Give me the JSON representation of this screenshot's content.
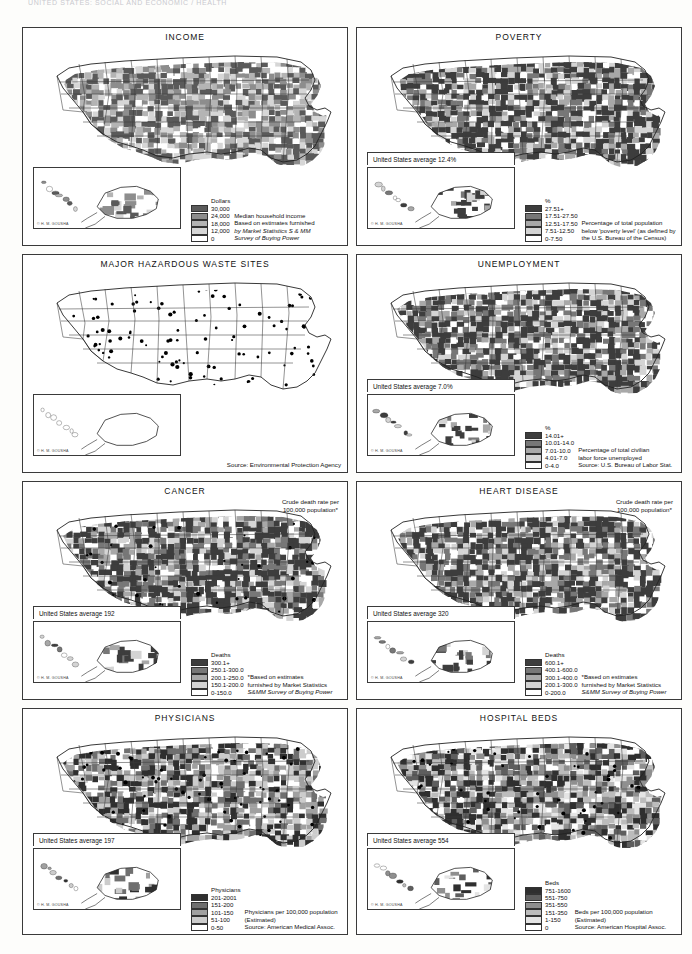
{
  "page": {
    "header": "UNITED STATES: SOCIAL AND ECONOMIC / HEALTH"
  },
  "copyright_mark": "© H. M. GOUSHA",
  "legend_unit_labels": {
    "dollars": "Dollars",
    "percent": "%",
    "deaths": "Deaths",
    "physicians": "Physicians",
    "beds": "Beds"
  },
  "panels": [
    {
      "id": "income",
      "title": "INCOME",
      "us_average": "",
      "legend_unit": "Dollars",
      "legend_classes": [
        {
          "label": "30,000",
          "color": "#5a5a5a"
        },
        {
          "label": "24,000",
          "color": "#8d8d8d"
        },
        {
          "label": "18,000",
          "color": "#b4b4b4"
        },
        {
          "label": "12,000",
          "color": "#d6d6d6"
        },
        {
          "label": "0",
          "color": "#ffffff"
        }
      ],
      "note_lines": [
        "Median household income",
        "Based on estimates furnished",
        "by Market Statistics S & MM",
        "Survey of Buying Power"
      ],
      "note_italic_lines": [
        2,
        3
      ],
      "top_note": "",
      "source_note": ""
    },
    {
      "id": "poverty",
      "title": "POVERTY",
      "us_average": "United States average 12.4%",
      "legend_unit": "%",
      "legend_classes": [
        {
          "label": "27.51+",
          "color": "#3d3d3d"
        },
        {
          "label": "17.51-27.50",
          "color": "#777777"
        },
        {
          "label": "12.51-17.50",
          "color": "#a8a8a8"
        },
        {
          "label": "7.51-12.50",
          "color": "#d4d4d4"
        },
        {
          "label": "0-7.50",
          "color": "#ffffff"
        }
      ],
      "note_lines": [
        "Percentage of total population",
        "below 'poverty level' (as defined by",
        "the U.S. Bureau of the Census)"
      ],
      "note_italic_lines": [],
      "top_note": "",
      "source_note": ""
    },
    {
      "id": "hazardous-waste",
      "title": "MAJOR HAZARDOUS WASTE SITES",
      "us_average": "",
      "legend_unit": "",
      "legend_classes": [],
      "note_lines": [],
      "note_italic_lines": [],
      "top_note": "",
      "source_note": "Source: Environmental Protection Agency"
    },
    {
      "id": "unemployment",
      "title": "UNEMPLOYMENT",
      "us_average": "United States average 7.0%",
      "legend_unit": "%",
      "legend_classes": [
        {
          "label": "14.01+",
          "color": "#3d3d3d"
        },
        {
          "label": "10.01-14.0",
          "color": "#777777"
        },
        {
          "label": "7.01-10.0",
          "color": "#a8a8a8"
        },
        {
          "label": "4.01-7.0",
          "color": "#d4d4d4"
        },
        {
          "label": "0-4.0",
          "color": "#ffffff"
        }
      ],
      "note_lines": [
        "Percentage of total civilian",
        "labor force unemployed",
        "Source: U.S. Bureau of Labor Stat."
      ],
      "note_italic_lines": [],
      "top_note": "",
      "source_note": ""
    },
    {
      "id": "cancer",
      "title": "CANCER",
      "us_average": "United States average 192",
      "legend_unit": "Deaths",
      "legend_classes": [
        {
          "label": "300.1+",
          "color": "#3d3d3d"
        },
        {
          "label": "250.1-300.0",
          "color": "#777777"
        },
        {
          "label": "200.1-250.0",
          "color": "#a8a8a8"
        },
        {
          "label": "150.1-200.0",
          "color": "#d4d4d4"
        },
        {
          "label": "0-150.0",
          "color": "#ffffff"
        }
      ],
      "note_lines": [
        "*Based on estimates",
        "furnished by Market Statistics",
        "S&MM Survey of Buying Power"
      ],
      "note_italic_lines": [
        2
      ],
      "top_note": "Crude death rate per\n100,000 population*",
      "source_note": ""
    },
    {
      "id": "heart-disease",
      "title": "HEART DISEASE",
      "us_average": "United States average 320",
      "legend_unit": "Deaths",
      "legend_classes": [
        {
          "label": "600.1+",
          "color": "#3d3d3d"
        },
        {
          "label": "400.1-600.0",
          "color": "#777777"
        },
        {
          "label": "300.1-400.0",
          "color": "#a8a8a8"
        },
        {
          "label": "200.1-300.0",
          "color": "#d4d4d4"
        },
        {
          "label": "0-200.0",
          "color": "#ffffff"
        }
      ],
      "note_lines": [
        "*Based on estimates",
        "furnished by Market Statistics",
        "S&MM Survey of Buying Power"
      ],
      "note_italic_lines": [
        2
      ],
      "top_note": "Crude death rate per\n100,000 population*",
      "source_note": ""
    },
    {
      "id": "physicians",
      "title": "PHYSICIANS",
      "us_average": "United States average 197",
      "legend_unit": "Physicians",
      "legend_classes": [
        {
          "label": "201-2001",
          "color": "#2f2f2f"
        },
        {
          "label": "151-200",
          "color": "#6f6f6f"
        },
        {
          "label": "101-150",
          "color": "#a0a0a0"
        },
        {
          "label": "51-100",
          "color": "#cccccc"
        },
        {
          "label": "0-50",
          "color": "#ffffff"
        }
      ],
      "note_lines": [
        "Physicians per 100,000 population",
        "(Estimated)",
        "Source: American Medical Assoc."
      ],
      "note_italic_lines": [],
      "top_note": "",
      "source_note": ""
    },
    {
      "id": "hospital-beds",
      "title": "HOSPITAL BEDS",
      "us_average": "United States average 554",
      "legend_unit": "Beds",
      "legend_classes": [
        {
          "label": "751-1600",
          "color": "#2f2f2f"
        },
        {
          "label": "551-750",
          "color": "#5e5e5e"
        },
        {
          "label": "351-550",
          "color": "#8f8f8f"
        },
        {
          "label": "151-350",
          "color": "#bcbcbc"
        },
        {
          "label": "1-150",
          "color": "#e4e4e4"
        },
        {
          "label": "0",
          "color": "#ffffff"
        }
      ],
      "note_lines": [
        "Beds per 100,000 population",
        "(Estimated)",
        "Source: American Hospital Assoc."
      ],
      "note_italic_lines": [],
      "top_note": "",
      "source_note": ""
    }
  ]
}
